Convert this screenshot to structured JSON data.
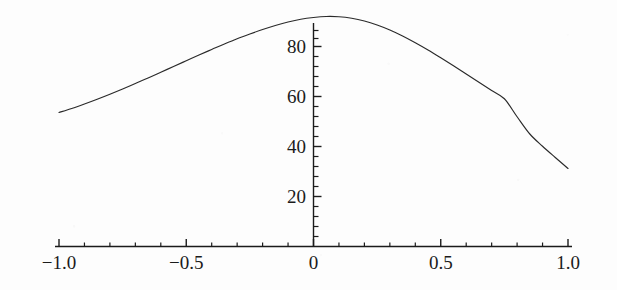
{
  "figure": {
    "kind": "mathematica-plot",
    "background_color": "#fdfdfd",
    "ink_color": "#1b1b1b"
  },
  "chart_data": {
    "type": "line",
    "title": "",
    "subtitle": "",
    "xlabel": "",
    "ylabel": "",
    "xlim": [
      -1.0,
      1.0
    ],
    "ylim": [
      0,
      98
    ],
    "grid": false,
    "legend": null,
    "legend_position": "none",
    "annotations": [],
    "axes": {
      "x_axis_position_y": 0,
      "y_axis_position_x": 0,
      "x_tick_labels": [
        "-1.0",
        "-0.5",
        "0",
        "0.5",
        "1.0"
      ],
      "x_tick_values": [
        -1.0,
        -0.5,
        0,
        0.5,
        1.0
      ],
      "x_minor_tick_count_between": 4,
      "y_tick_labels": [
        "20",
        "40",
        "60",
        "80"
      ],
      "y_tick_values": [
        20,
        40,
        60,
        80
      ],
      "y_minor_tick_count_between": 4
    },
    "series": [
      {
        "name": "curve",
        "color": "#2a2a2a",
        "line_width": 1,
        "x": [
          -1.0,
          -0.95,
          -0.9,
          -0.85,
          -0.8,
          -0.75,
          -0.7,
          -0.65,
          -0.6,
          -0.55,
          -0.5,
          -0.45,
          -0.4,
          -0.35,
          -0.3,
          -0.25,
          -0.2,
          -0.15,
          -0.1,
          -0.05,
          0.0,
          0.05,
          0.1,
          0.15,
          0.2,
          0.25,
          0.3,
          0.35,
          0.4,
          0.45,
          0.5,
          0.55,
          0.6,
          0.65,
          0.7,
          0.75,
          0.8,
          0.85,
          0.9,
          0.95,
          1.0
        ],
        "y": [
          53.6,
          55.2,
          57.0,
          58.9,
          60.9,
          63.0,
          65.2,
          67.4,
          69.7,
          72.0,
          74.3,
          76.6,
          78.8,
          81.0,
          83.1,
          85.0,
          86.8,
          88.4,
          89.8,
          90.9,
          91.6,
          92.0,
          91.9,
          91.3,
          90.2,
          88.6,
          86.6,
          84.2,
          81.5,
          78.6,
          75.5,
          72.3,
          69.0,
          65.7,
          62.4,
          59.1,
          51.9,
          45.0,
          40.1,
          35.6,
          31.2
        ]
      }
    ]
  }
}
